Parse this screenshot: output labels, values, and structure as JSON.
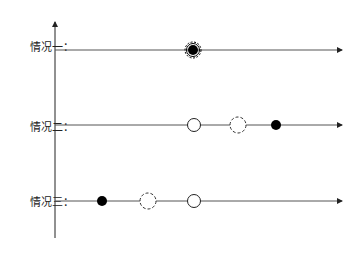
{
  "diagram": {
    "cases": [
      {
        "label": "情况一：",
        "y": 45
      },
      {
        "label": "情况二：",
        "y": 125
      },
      {
        "label": "情况三：",
        "y": 200
      }
    ],
    "colors": {
      "line": "#555555",
      "axis": "#222222",
      "fill": "#000000"
    }
  }
}
